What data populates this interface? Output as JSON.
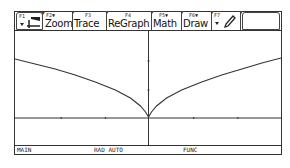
{
  "toolbar": {
    "tabs": [
      {
        "fkey": "F1",
        "label": "",
        "icon": "tools-icon"
      },
      {
        "fkey": "F2▼",
        "label": "Zoom"
      },
      {
        "fkey": "F3",
        "label": "Trace"
      },
      {
        "fkey": "F4",
        "label": "ReGraph"
      },
      {
        "fkey": "F5▼",
        "label": "Math"
      },
      {
        "fkey": "F6▼",
        "label": "Draw"
      },
      {
        "fkey": "F7",
        "label": "",
        "icon": "pencil-icon"
      },
      {
        "fkey": "",
        "label": ""
      }
    ]
  },
  "graph": {
    "function_shape": "y = |x|^(2/3)-like cusp at origin",
    "x_axis_ticks": 4,
    "y_axis_ticks": 2
  },
  "status": {
    "folder": "MAIN",
    "mode": "RAD AUTO",
    "graph_mode": "FUNC"
  }
}
